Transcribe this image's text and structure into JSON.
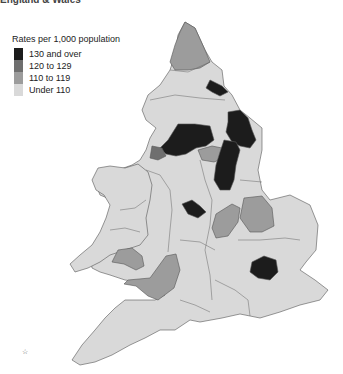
{
  "title": "England & Wales",
  "legend": {
    "title": "Rates per 1,000 population",
    "items": [
      {
        "label": "130 and over",
        "color": "#1c1c1c"
      },
      {
        "label": "120 to 129",
        "color": "#6f6f6f"
      },
      {
        "label": "110 to 119",
        "color": "#9c9c9c"
      },
      {
        "label": "Under 110",
        "color": "#d9d9d9"
      }
    ]
  },
  "map": {
    "type": "choropleth",
    "area": "England & Wales",
    "measure": "Rates per 1,000 population",
    "classes": [
      "130 and over",
      "120 to 129",
      "110 to 119",
      "Under 110"
    ],
    "regions_by_class": {
      "130 and over": [
        "Durham/Teesside",
        "Humberside/North Yorkshire coast",
        "West Yorkshire / Lancashire belt",
        "South Yorkshire-Nottinghamshire strip",
        "West Midlands",
        "Greater London"
      ],
      "120 to 129": [
        "Merseyside"
      ],
      "110 to 119": [
        "Northumberland",
        "Greater Manchester (part)",
        "Northamptonshire",
        "Cambridgeshire",
        "Gwent",
        "Avon/Somerset"
      ],
      "Under 110": [
        "All other areas"
      ]
    }
  },
  "compass_mark": "☆"
}
